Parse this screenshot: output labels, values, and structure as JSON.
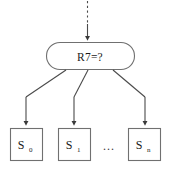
{
  "diagram": {
    "type": "decision-tree-fragment",
    "background_color": "#ffffff",
    "stroke_color": "#707070",
    "edge_color": "#4a4a4a",
    "text_color": "#1a1a1a",
    "decision_node": {
      "shape": "rounded-rectangle",
      "label": "R7=?"
    },
    "incoming_edge": {
      "style": "dashed",
      "arrow": "down"
    },
    "leaves": [
      {
        "base": "S",
        "subscript": "0",
        "full": "S0"
      },
      {
        "base": "S",
        "subscript": "1",
        "full": "S1"
      },
      {
        "base": "S",
        "subscript": "n",
        "full": "Sn"
      }
    ],
    "ellipsis": "...",
    "branch_edges": [
      {
        "style": "solid",
        "arrow": "down",
        "target": "S0"
      },
      {
        "style": "solid",
        "arrow": "down",
        "target": "S1"
      },
      {
        "style": "solid",
        "arrow": "down",
        "target": "Sn"
      }
    ]
  }
}
